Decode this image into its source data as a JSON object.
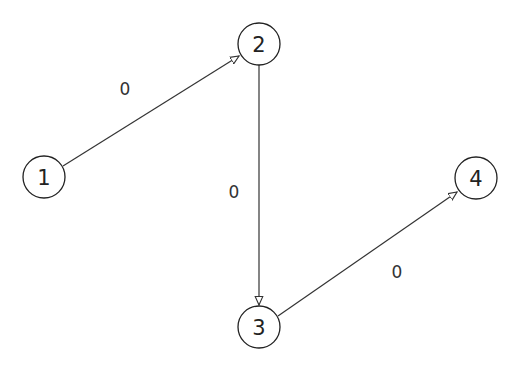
{
  "diagram": {
    "type": "directed-graph",
    "nodes": [
      {
        "id": "1",
        "label": "1",
        "x": 44,
        "y": 177
      },
      {
        "id": "2",
        "label": "2",
        "x": 259,
        "y": 44
      },
      {
        "id": "3",
        "label": "3",
        "x": 259,
        "y": 327
      },
      {
        "id": "4",
        "label": "4",
        "x": 476,
        "y": 178
      }
    ],
    "edges": [
      {
        "from": "1",
        "to": "2",
        "label": "0"
      },
      {
        "from": "2",
        "to": "3",
        "label": "0"
      },
      {
        "from": "3",
        "to": "4",
        "label": "0"
      }
    ]
  }
}
